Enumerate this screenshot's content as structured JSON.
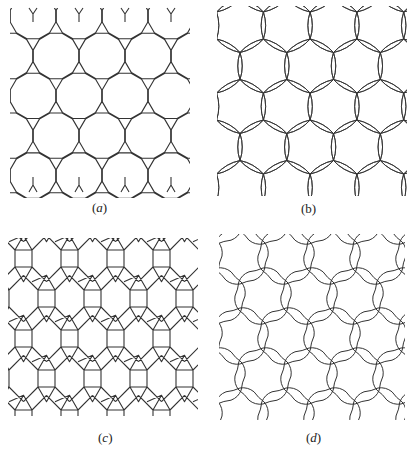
{
  "figure": {
    "panels": [
      {
        "id": "a",
        "label": "(a)",
        "label_letter": "a",
        "description": "Truncated hexagonal tiling: dodecagons joined by small triangles",
        "box": [
          0,
          0,
          205,
          200
        ],
        "label_pos": [
          90,
          200
        ]
      },
      {
        "id": "b",
        "label": "(b)",
        "label_letter": "b",
        "description": "Hexagonal net with lens-shaped (doubled curved) edges",
        "box": [
          205,
          0,
          210,
          200
        ],
        "label_pos": [
          300,
          200
        ]
      },
      {
        "id": "c",
        "label": "(c)",
        "label_letter": "c",
        "description": "Tiling of hexagons, squares and triangles",
        "box": [
          0,
          228,
          205,
          198
        ],
        "label_pos": [
          97,
          430
        ]
      },
      {
        "id": "d",
        "label": "(d)",
        "label_letter": "d",
        "description": "Interlaced arcs forming overlapping rosette circles",
        "box": [
          205,
          228,
          210,
          198
        ],
        "label_pos": [
          306,
          430
        ]
      }
    ],
    "stroke_color": "#333333",
    "background": "#ffffff"
  }
}
